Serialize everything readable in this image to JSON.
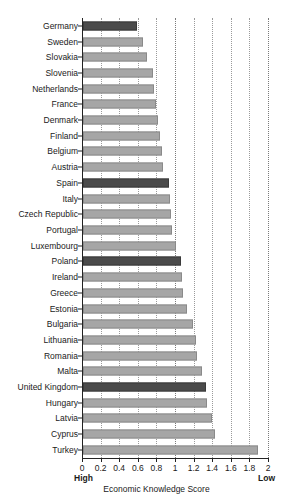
{
  "chart_data": {
    "type": "bar",
    "orientation": "horizontal",
    "title": "",
    "xlabel": "Economic Knowledge Score",
    "ylabel": "",
    "xlim": [
      0,
      2
    ],
    "xticks": [
      0,
      0.2,
      0.4,
      0.6,
      0.8,
      1,
      1.2,
      1.4,
      1.6,
      1.8,
      2
    ],
    "xtick_labels": [
      "0",
      "0.2",
      "0.4",
      "0.6",
      "0.8",
      "1",
      "1.2",
      "1.4",
      "1.6",
      "1.8",
      "2"
    ],
    "axis_endcap_low_value": "High",
    "axis_endcap_high_value": "Low",
    "grid": "vertical-dotted",
    "legend": "none",
    "bar_color": "#a6a6a6",
    "highlight_color": "#4b4b4b",
    "categories": [
      "Germany",
      "Sweden",
      "Slovakia",
      "Slovenia",
      "Netherlands",
      "France",
      "Denmark",
      "Finland",
      "Belgium",
      "Austria",
      "Spain",
      "Italy",
      "Czech Republic",
      "Portugal",
      "Luxembourg",
      "Poland",
      "Ireland",
      "Greece",
      "Estonia",
      "Bulgaria",
      "Lithuania",
      "Romania",
      "Malta",
      "United Kingdom",
      "Hungary",
      "Latvia",
      "Cyprus",
      "Turkey"
    ],
    "values": [
      0.58,
      0.65,
      0.69,
      0.75,
      0.76,
      0.79,
      0.81,
      0.83,
      0.85,
      0.86,
      0.92,
      0.94,
      0.95,
      0.96,
      1.0,
      1.05,
      1.06,
      1.08,
      1.12,
      1.18,
      1.22,
      1.23,
      1.28,
      1.32,
      1.33,
      1.39,
      1.42,
      1.88
    ],
    "highlighted": [
      "Germany",
      "Spain",
      "Poland",
      "United Kingdom"
    ]
  }
}
